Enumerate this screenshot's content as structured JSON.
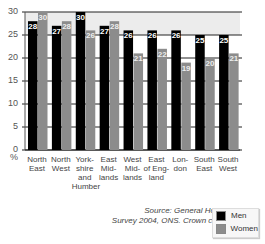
{
  "chart_data": {
    "type": "bar",
    "title": "",
    "xlabel": "",
    "ylabel": "%",
    "ylim": [
      0,
      30
    ],
    "yticks": [
      0,
      5,
      10,
      15,
      20,
      25,
      30
    ],
    "grid": true,
    "legend_position": "bottom-right",
    "categories": [
      "North East",
      "North West",
      "Yorkshire and Humber",
      "East Midlands",
      "West Midlands",
      "East of England",
      "London",
      "South East",
      "South West"
    ],
    "category_label_lines": [
      [
        "North",
        "East"
      ],
      [
        "North",
        "West"
      ],
      [
        "York-",
        "shire",
        "and",
        "Humber"
      ],
      [
        "East",
        "Mid-",
        "lands"
      ],
      [
        "West",
        "Mid-",
        "lands"
      ],
      [
        "East",
        "of Eng-",
        "land"
      ],
      [
        "Lon-",
        "don"
      ],
      [
        "South",
        "East"
      ],
      [
        "South",
        "West"
      ]
    ],
    "series": [
      {
        "name": "Men",
        "color": "#000000",
        "values": [
          28,
          27,
          30,
          27,
          26,
          26,
          26,
          25,
          25
        ]
      },
      {
        "name": "Women",
        "color": "#8c8c8c",
        "values": [
          30,
          28,
          26,
          28,
          21,
          22,
          19,
          20,
          21
        ]
      }
    ],
    "annotation": "Source: General Household Survey 2004, ONS. Crown copyright."
  },
  "axis": {
    "unit_label": "%"
  },
  "source": {
    "line1": "Source: General Household",
    "line2": "Survey 2004, ONS. Crown copyright."
  },
  "legend": {
    "men_label": "Men",
    "women_label": "Women"
  }
}
